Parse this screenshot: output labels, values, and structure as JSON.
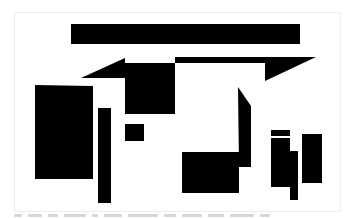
{
  "artwork": {
    "fill": "#000000",
    "background": "#ffffff",
    "frame_border": "#ececec",
    "shapes": [
      {
        "name": "top-long-bar",
        "points": "71,24 300,24 300,44 71,44"
      },
      {
        "name": "left-wedge-triangle",
        "points": "81,78 125,58 125,78"
      },
      {
        "name": "central-square",
        "points": "125,63 175,63 175,114 125,114"
      },
      {
        "name": "top-right-wedge",
        "points": "175,57 316,57 265,81 265,63 175,63"
      },
      {
        "name": "left-tall-rectangle",
        "points": "35,85 93,86 93,179 35,179"
      },
      {
        "name": "left-thin-vertical-bar",
        "points": "98,108 111,108 111,203 98,203"
      },
      {
        "name": "small-square",
        "points": "125,124 144,124 144,141 125,141"
      },
      {
        "name": "slanted-vertical-shape",
        "points": "238,87 251,106 251,167 239,167"
      },
      {
        "name": "bottom-center-rectangle",
        "points": "182,152 239,152 239,193 182,193"
      },
      {
        "name": "right-small-cap-bar",
        "points": "271,130 290,130 290,136 271,136"
      },
      {
        "name": "right-tall-rectangle",
        "points": "271,138 290,138 290,187 271,187"
      },
      {
        "name": "right-narrow-bar",
        "points": "290,151 298,151 298,200 290,200"
      },
      {
        "name": "far-right-rectangle",
        "points": "302,134 322,134 322,183 302,183"
      }
    ]
  },
  "caption": {
    "text": "",
    "legible": false,
    "word_widths": [
      8,
      14,
      10,
      22,
      6,
      18,
      30,
      12,
      20,
      16,
      24,
      10
    ]
  }
}
